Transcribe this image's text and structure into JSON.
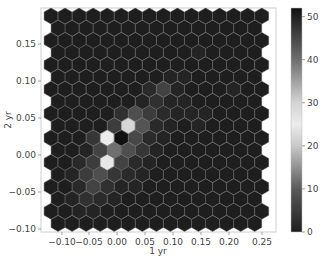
{
  "chart_data": {
    "type": "heatmap",
    "subtype": "hexbin",
    "title": "",
    "xlabel": "1 yr",
    "ylabel": "2 yr",
    "xlim": [
      -0.12,
      0.27
    ],
    "ylim": [
      -0.1,
      0.19
    ],
    "x_ticks": [
      -0.1,
      -0.05,
      0.0,
      0.05,
      0.1,
      0.15,
      0.2,
      0.25
    ],
    "x_tick_labels": [
      "−0.10",
      "−0.05",
      "0.00",
      "0.05",
      "0.10",
      "0.15",
      "0.20",
      "0.25"
    ],
    "y_ticks": [
      0.15,
      0.1,
      0.05,
      0.0,
      -0.05,
      -0.1
    ],
    "y_tick_labels": [
      "0.15",
      "0.10",
      "0.05",
      "0.00",
      "−0.05",
      "−0.10"
    ],
    "grid": false,
    "colorbar": {
      "min": 0,
      "max": 52,
      "ticks": [
        0,
        10,
        20,
        30,
        40,
        50
      ],
      "tick_labels": [
        "0",
        "10",
        "20",
        "30",
        "40",
        "50"
      ],
      "colormap": "diverging dark-light-dark (dark at 0, light near 25, black at max)",
      "stops": [
        {
          "v": 0,
          "color": "#1e1e1e"
        },
        {
          "v": 10,
          "color": "#5a5a5a"
        },
        {
          "v": 20,
          "color": "#c8c8c8"
        },
        {
          "v": 25,
          "color": "#ececec"
        },
        {
          "v": 30,
          "color": "#d4d4d4"
        },
        {
          "v": 40,
          "color": "#6e6e6e"
        },
        {
          "v": 52,
          "color": "#111111"
        }
      ]
    },
    "hex_grid": {
      "rows": 18,
      "even_row_cols": 16,
      "odd_row_cols": 15,
      "note": "values[row][col]; row 0 is top (y≈0.19), row 17 bottom (y≈-0.10); counts estimated from color",
      "values": [
        [
          0,
          0,
          0,
          0,
          0,
          0,
          0,
          0,
          0,
          0,
          0,
          0,
          0,
          0,
          0,
          0
        ],
        [
          0,
          0,
          0,
          0,
          0,
          0,
          0,
          0,
          0,
          0,
          0,
          0,
          0,
          0,
          0
        ],
        [
          0,
          0,
          0,
          0,
          0,
          0,
          0,
          0,
          0,
          0,
          0,
          0,
          0,
          0,
          0,
          0
        ],
        [
          0,
          0,
          0,
          0,
          0,
          0,
          0,
          0,
          0,
          0,
          1,
          0,
          0,
          0,
          0
        ],
        [
          0,
          0,
          0,
          0,
          0,
          0,
          0,
          0,
          0,
          0,
          0,
          0,
          0,
          0,
          0,
          0
        ],
        [
          0,
          0,
          0,
          0,
          0,
          0,
          0,
          0,
          1,
          1,
          0,
          0,
          0,
          0,
          0
        ],
        [
          0,
          0,
          0,
          0,
          0,
          0,
          0,
          2,
          6,
          1,
          0,
          0,
          0,
          1,
          0,
          0
        ],
        [
          0,
          0,
          0,
          0,
          0,
          0,
          1,
          3,
          1,
          1,
          0,
          0,
          0,
          0,
          0
        ],
        [
          0,
          0,
          0,
          0,
          0,
          3,
          8,
          5,
          2,
          1,
          1,
          1,
          0,
          0,
          0,
          0
        ],
        [
          0,
          0,
          0,
          0,
          5,
          22,
          9,
          2,
          1,
          0,
          1,
          0,
          0,
          0,
          0
        ],
        [
          0,
          0,
          0,
          4,
          25,
          52,
          7,
          2,
          1,
          0,
          0,
          0,
          0,
          0,
          0,
          0
        ],
        [
          0,
          0,
          1,
          6,
          12,
          8,
          4,
          1,
          0,
          0,
          0,
          0,
          0,
          0,
          0
        ],
        [
          0,
          0,
          2,
          5,
          26,
          6,
          2,
          1,
          0,
          0,
          0,
          0,
          0,
          0,
          0,
          0
        ],
        [
          0,
          1,
          5,
          8,
          4,
          2,
          1,
          0,
          0,
          0,
          0,
          0,
          0,
          0,
          0
        ],
        [
          0,
          0,
          2,
          6,
          3,
          1,
          1,
          0,
          0,
          0,
          0,
          0,
          0,
          0,
          0,
          0
        ],
        [
          0,
          1,
          3,
          2,
          1,
          0,
          0,
          0,
          0,
          0,
          0,
          0,
          0,
          0,
          0
        ],
        [
          0,
          0,
          1,
          1,
          0,
          0,
          0,
          0,
          0,
          0,
          0,
          0,
          0,
          0,
          0,
          0
        ],
        [
          0,
          0,
          0,
          0,
          0,
          0,
          0,
          0,
          0,
          0,
          0,
          0,
          0,
          0,
          0
        ]
      ]
    }
  },
  "layout": {
    "plot": {
      "x": 41,
      "y": 8,
      "w": 235,
      "h": 224
    },
    "colorbar": {
      "x": 291,
      "y": 8,
      "w": 11,
      "h": 224
    },
    "hex": {
      "x0": 51,
      "y0": 16,
      "dx": 14.05,
      "dy": 12.2,
      "r": 8.0
    },
    "x_tick_px": [
      62,
      89,
      117,
      145,
      173,
      201,
      229,
      262
    ],
    "y_tick_px": [
      44,
      81,
      118,
      155,
      192,
      229
    ],
    "edge_color": "#5a5a5a"
  }
}
